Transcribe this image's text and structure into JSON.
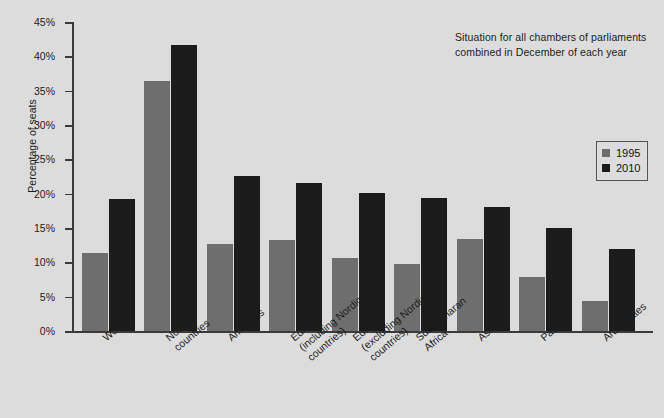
{
  "chart_data": {
    "type": "bar",
    "title": "",
    "subtitle": "",
    "annotation_line1": "Situation for all chambers of parliaments",
    "annotation_line2": "combined in December of each year",
    "xlabel": "",
    "ylabel": "Percentage of seats",
    "ylim": [
      0,
      45
    ],
    "ytick_step": 5,
    "grid": false,
    "legend_position": "right",
    "categories": [
      "World",
      "Nordic countries",
      "Americas",
      "Europe (including Nordic countries)",
      "Europe (excluding Nordic countries)",
      "Sub-Saharan Africa",
      "Asia",
      "Pacific",
      "Arab states"
    ],
    "category_lines": [
      [
        "World"
      ],
      [
        "Nordic",
        "countries"
      ],
      [
        "Americas"
      ],
      [
        "Europe",
        "(including Nordic",
        "countries)"
      ],
      [
        "Europe",
        "(excluding Nordic",
        "countries)"
      ],
      [
        "Sub-Saharan",
        "Africa"
      ],
      [
        "Asia"
      ],
      [
        "Pacific"
      ],
      [
        "Arab states"
      ]
    ],
    "ytick_labels": [
      "45%",
      "40%",
      "35%",
      "30%",
      "25%",
      "20%",
      "15%",
      "10%",
      "5%",
      "0%"
    ],
    "ytick_values": [
      45,
      40,
      35,
      30,
      25,
      20,
      15,
      10,
      5,
      0
    ],
    "series": [
      {
        "name": "1995",
        "color": "#6e6e6e",
        "values": [
          11.3,
          36.4,
          12.7,
          13.2,
          10.7,
          9.8,
          13.4,
          7.9,
          4.4
        ]
      },
      {
        "name": "2010",
        "color": "#1c1c1c",
        "values": [
          19.2,
          41.6,
          22.6,
          21.6,
          20.1,
          19.4,
          18.1,
          15.0,
          11.9
        ]
      }
    ]
  },
  "legend": {
    "items": [
      {
        "label": "1995",
        "color": "#6e6e6e"
      },
      {
        "label": "2010",
        "color": "#1c1c1c"
      }
    ]
  },
  "colors": {
    "background": "#dcdcdc",
    "axis": "#3a3a3a",
    "text": "#1c1c1c",
    "series_1995": "#6e6e6e",
    "series_2010": "#1c1c1c"
  }
}
